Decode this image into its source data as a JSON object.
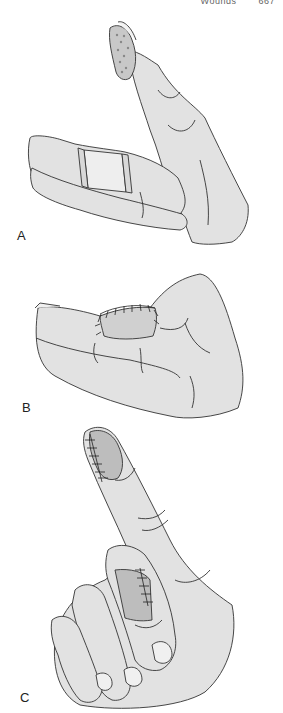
{
  "running_head": {
    "title": "Wounds",
    "page": "667"
  },
  "figure": {
    "panels": [
      {
        "label": "A",
        "description": "Hand with index fingertip wound dressed with gauze and middle finger splinted",
        "colors": {
          "skin": "#e2e2e2",
          "outline": "#333333",
          "dressing": "#c8c8c8",
          "splint": "#eeeeee"
        }
      },
      {
        "label": "B",
        "description": "Hand with sutured skin graft on dorsum of proximal finger",
        "colors": {
          "skin": "#e2e2e2",
          "outline": "#333333",
          "graft": "#d0d0d0"
        }
      },
      {
        "label": "C",
        "description": "Hand with sutured grafts on index fingertip and middle finger",
        "colors": {
          "skin": "#e2e2e2",
          "outline": "#333333",
          "graft": "#bdbdbd",
          "nail": "#f0f0f0"
        }
      }
    ]
  }
}
